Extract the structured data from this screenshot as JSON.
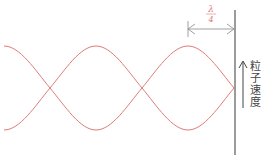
{
  "diagram": {
    "type": "standing-wave",
    "wave": {
      "color": "#e07a7a",
      "center_y": 88,
      "amplitude": 42,
      "half_wavelength_px": 92,
      "node_x": [
        50,
        142,
        234
      ]
    },
    "dimension": {
      "label_numerator": "λ",
      "label_denominator": "4",
      "label_color": "#e07a7a",
      "line_color": "#888888"
    },
    "boundary_line_color": "#666666",
    "velocity_arrow_color": "#444444",
    "velocity_label": [
      "粒",
      "子",
      "速",
      "度"
    ]
  }
}
